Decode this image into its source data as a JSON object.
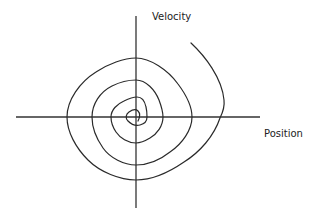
{
  "diagram": {
    "type": "phase-portrait",
    "axes": {
      "x_label": "Position",
      "y_label": "Velocity"
    },
    "colors": {
      "line": "#2a2a2a",
      "axis": "#333333",
      "background": "#ffffff"
    },
    "trajectory": {
      "shape": "inward-spiral",
      "turns": 4,
      "start_point": "upper-right",
      "end_point": "origin"
    }
  }
}
